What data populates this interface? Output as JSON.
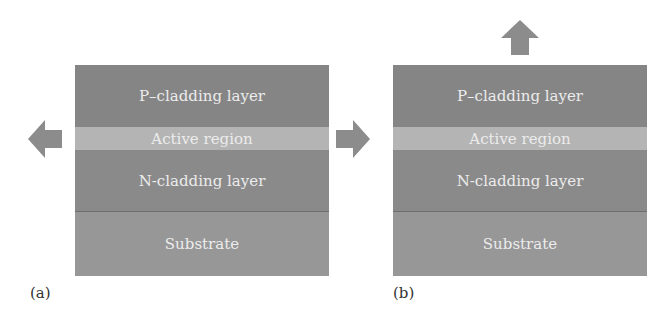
{
  "panels": [
    {
      "id": "a",
      "caption": "(a)",
      "emission": "edge",
      "layers": {
        "p_cladding": "P–cladding layer",
        "active": "Active region",
        "n_cladding": "N-cladding layer",
        "substrate": "Substrate"
      },
      "arrows": [
        "left",
        "right"
      ]
    },
    {
      "id": "b",
      "caption": "(b)",
      "emission": "surface",
      "layers": {
        "p_cladding": "P–cladding layer",
        "active": "Active region",
        "n_cladding": "N-cladding layer",
        "substrate": "Substrate"
      },
      "arrows": [
        "up"
      ]
    }
  ],
  "colors": {
    "p_cladding": "#858585",
    "active": "#b4b4b4",
    "n_cladding": "#8a8a8a",
    "substrate": "#979797",
    "arrow": "#8c8c8c"
  }
}
